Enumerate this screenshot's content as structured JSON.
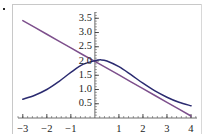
{
  "figure": {
    "background_color": "#ffffff",
    "frame_color": "#c8c8c8",
    "artifact_dot": "•"
  },
  "chart_data": {
    "type": "line",
    "title": "",
    "xlabel": "",
    "ylabel": "",
    "xlim": [
      -3.2,
      4.25
    ],
    "ylim": [
      0.0,
      3.72
    ],
    "grid": false,
    "legend": "none",
    "axis_style": "crossed-at-origin",
    "x_ticks": [
      -3,
      -2,
      -1,
      1,
      2,
      3,
      4
    ],
    "x_tick_labels": [
      "−3",
      "−2",
      "−1",
      "1",
      "2",
      "3",
      "4"
    ],
    "y_ticks": [
      0.5,
      1.0,
      1.5,
      2.0,
      2.5,
      3.0,
      3.5
    ],
    "y_tick_labels": [
      "0.5",
      "1.0",
      "1.5",
      "2.0",
      "2.5",
      "3.0",
      "3.5"
    ],
    "x_minor_tick_step": 0.2,
    "y_minor_tick_step": 0.1,
    "series": [
      {
        "name": "purple-line",
        "color": "#7d4f8c",
        "style": "straight-line",
        "x": [
          -3.0,
          -2.5,
          -2.0,
          -1.5,
          -1.0,
          -0.5,
          0.0,
          0.5,
          1.0,
          1.5,
          2.0,
          2.5,
          3.0,
          3.5,
          4.0
        ],
        "values": [
          3.42,
          3.18,
          2.94,
          2.7,
          2.46,
          2.22,
          1.99,
          1.75,
          1.51,
          1.27,
          1.03,
          0.79,
          0.55,
          0.31,
          0.07
        ]
      },
      {
        "name": "blue-curve",
        "color": "#2b2b70",
        "style": "curve",
        "x": [
          -3.0,
          -2.5,
          -2.0,
          -1.5,
          -1.0,
          -0.5,
          0.0,
          0.25,
          0.5,
          1.0,
          1.5,
          2.0,
          2.5,
          3.0,
          3.5,
          4.0
        ],
        "values": [
          0.66,
          0.8,
          1.0,
          1.28,
          1.6,
          1.88,
          2.01,
          2.04,
          2.0,
          1.8,
          1.52,
          1.22,
          0.95,
          0.73,
          0.55,
          0.43
        ]
      }
    ]
  }
}
